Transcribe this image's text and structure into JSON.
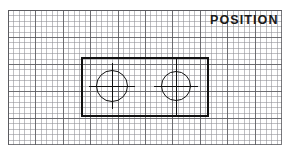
{
  "figure": {
    "title": "POSITION",
    "type": "engineering-drawing",
    "background": "graph-paper",
    "colors": {
      "line": "#111111",
      "grid_minor": "#8c8c92",
      "grid_major": "#58585c",
      "paper": "#ffffff",
      "text": "#1a1a1a"
    }
  },
  "grid": {
    "minor_cell_px": 5.5,
    "major_every_n_cells": 5,
    "left": 8,
    "top": 10,
    "width": 274,
    "height": 135
  },
  "drawing": {
    "plate": {
      "label": "plate-outline",
      "x": 81,
      "y": 57,
      "width": 128,
      "height": 60
    },
    "holes": [
      {
        "label": "hole-left",
        "cx": 112,
        "cy": 86,
        "diameter": 32
      },
      {
        "label": "hole-right",
        "cx": 176,
        "cy": 86,
        "diameter": 30
      }
    ],
    "centerlines": [
      {
        "label": "centerline-horizontal-left",
        "orientation": "horizontal"
      },
      {
        "label": "centerline-horizontal-right",
        "orientation": "horizontal"
      },
      {
        "label": "centerline-vertical-left",
        "orientation": "vertical"
      },
      {
        "label": "centerline-vertical-right",
        "orientation": "vertical"
      }
    ]
  }
}
